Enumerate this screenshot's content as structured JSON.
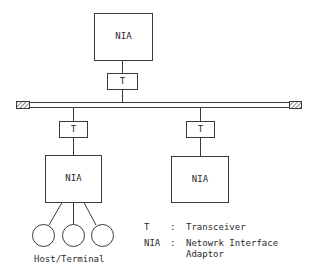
{
  "diagram": {
    "type": "bus-network",
    "nodes": {
      "top_nia": {
        "label": "NIA"
      },
      "top_transceiver": {
        "label": "T"
      },
      "left_transceiver": {
        "label": "T"
      },
      "right_transceiver": {
        "label": "T"
      },
      "left_nia": {
        "label": "NIA"
      },
      "right_nia": {
        "label": "NIA"
      }
    },
    "hosts": {
      "count": 3,
      "label": "Host/Terminal"
    },
    "bus": {
      "terminators": 2
    },
    "legend": [
      {
        "key": "T",
        "sep": ":",
        "value": "Transceiver"
      },
      {
        "key": "NIA",
        "sep": ":",
        "value": "Netowrk Interface",
        "value2": "Adaptor"
      }
    ],
    "colors": {
      "line": "#3a3a3a",
      "background": "#ffffff"
    }
  }
}
